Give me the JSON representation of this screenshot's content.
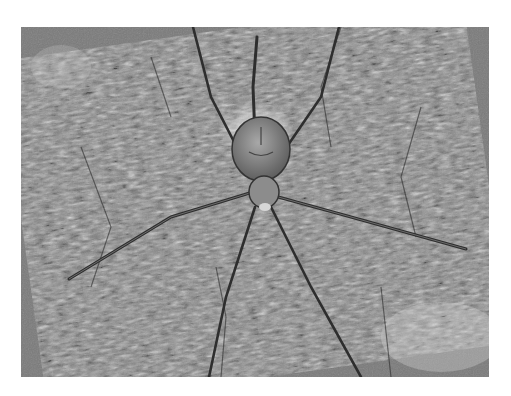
{
  "image": {
    "subject": "spider on tree bark",
    "style": "black and white photograph",
    "frame": {
      "x": 21,
      "y": 27,
      "width": 468,
      "height": 350
    },
    "colors": {
      "background": "#ffffff",
      "bark_mid": "#7a7a7a",
      "bark_dark": "#3a3a3a",
      "bark_light": "#c8c8c8",
      "spider_body": "#8c8c8c",
      "spider_legs": "#2e2e2e"
    }
  }
}
